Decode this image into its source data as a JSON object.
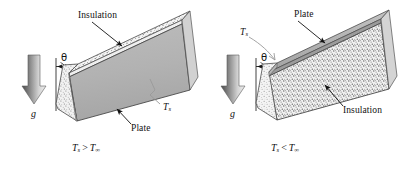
{
  "figure": {
    "background_color": "#ffffff",
    "ink_color": "#111111",
    "plate_face_color": "#b0b0b0",
    "plate_edge_color": "#8f8f8f",
    "insulation_color": "#f2f2f2",
    "speckle_color": "#6e6e6e",
    "gravity_arrow_dark": "#555555",
    "gravity_arrow_light": "#e8e8e8"
  },
  "panels": [
    {
      "id": "left",
      "caption": {
        "t": "T",
        "s": "s",
        "rel": " > ",
        "t2": "T",
        "inf": "∞"
      },
      "caption_text": "Ts > T∞",
      "angle_label": "θ",
      "gravity_label": "g",
      "callouts": [
        {
          "name": "insulation",
          "label": "Insulation"
        },
        {
          "name": "plate",
          "label": "Plate"
        },
        {
          "name": "surface-temperature",
          "label": "Ts",
          "base": "T",
          "sub": "s"
        }
      ]
    },
    {
      "id": "right",
      "caption": {
        "t": "T",
        "s": "s",
        "rel": " < ",
        "t2": "T",
        "inf": "∞"
      },
      "caption_text": "Ts < T∞",
      "angle_label": "θ",
      "gravity_label": "g",
      "callouts": [
        {
          "name": "plate",
          "label": "Plate"
        },
        {
          "name": "insulation",
          "label": "Insulation"
        },
        {
          "name": "surface-temperature",
          "label": "Ts",
          "base": "T",
          "sub": "s"
        }
      ]
    }
  ],
  "labels": {
    "insulation": "Insulation",
    "plate": "Plate",
    "temp_base": "T",
    "temp_sub_s": "s",
    "temp_sub_inf": "∞",
    "rel_greater": ">",
    "rel_less": "<",
    "theta": "θ",
    "gravity": "g"
  }
}
